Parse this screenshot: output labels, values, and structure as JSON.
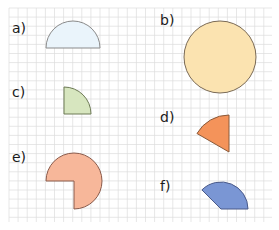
{
  "figure": {
    "grid_color": "#dcdcdc",
    "stroke_color": "#6b5a4a",
    "shapes": [
      {
        "id": "a",
        "label": "a)",
        "kind": "semicircle",
        "fill": "#eaf4fb",
        "stroke": "#8a8a8a",
        "degrees": 180
      },
      {
        "id": "b",
        "label": "b)",
        "kind": "full-circle",
        "fill": "#fbe3b0",
        "stroke": "#7a6a55",
        "degrees": 360
      },
      {
        "id": "c",
        "label": "c)",
        "kind": "quarter-circle",
        "fill": "#d7e6bf",
        "stroke": "#6d7a55",
        "degrees": 90
      },
      {
        "id": "d",
        "label": "d)",
        "kind": "sector",
        "fill": "#f4935a",
        "stroke": "#8a5a3a",
        "degrees": 60
      },
      {
        "id": "e",
        "label": "e)",
        "kind": "three-quarter-circle",
        "fill": "#f7b79a",
        "stroke": "#8a5a4a",
        "degrees": 270
      },
      {
        "id": "f",
        "label": "f)",
        "kind": "sector",
        "fill": "#7a96d4",
        "stroke": "#4a5a8a",
        "degrees": 135
      }
    ]
  }
}
